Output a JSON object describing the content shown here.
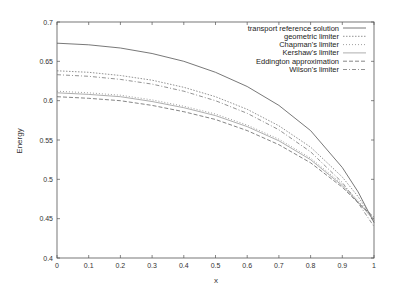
{
  "chart_data": {
    "type": "line",
    "title": "",
    "xlabel": "x",
    "ylabel": "Energy",
    "xlim": [
      0,
      1
    ],
    "ylim": [
      0.4,
      0.7
    ],
    "xticks": [
      "0",
      "0.1",
      "0.2",
      "0.3",
      "0.4",
      "0.5",
      "0.6",
      "0.7",
      "0.8",
      "0.9",
      "1"
    ],
    "yticks": [
      "0.4",
      "0.45",
      "0.5",
      "0.55",
      "0.6",
      "0.65",
      "0.7"
    ],
    "grid": false,
    "legend_position": "upper right (inside)",
    "x": [
      0,
      0.1,
      0.2,
      0.3,
      0.4,
      0.5,
      0.6,
      0.7,
      0.8,
      0.9,
      0.95,
      1.0
    ],
    "series": [
      {
        "name": "transport reference solution",
        "style": "solid",
        "color": "#555555",
        "values": [
          0.673,
          0.671,
          0.667,
          0.66,
          0.65,
          0.636,
          0.618,
          0.594,
          0.562,
          0.515,
          0.484,
          0.445
        ]
      },
      {
        "name": "geometric limiter",
        "style": "dotted",
        "color": "#777777",
        "values": [
          0.638,
          0.636,
          0.632,
          0.626,
          0.617,
          0.605,
          0.589,
          0.568,
          0.541,
          0.503,
          0.478,
          0.448
        ]
      },
      {
        "name": "Chapman's limiter",
        "style": "dotted-fine",
        "color": "#888888",
        "values": [
          0.612,
          0.61,
          0.607,
          0.601,
          0.593,
          0.583,
          0.569,
          0.551,
          0.527,
          0.494,
          0.473,
          0.45
        ]
      },
      {
        "name": "Kershaw's limiter",
        "style": "solid-light",
        "color": "#999999",
        "values": [
          0.61,
          0.608,
          0.605,
          0.599,
          0.591,
          0.581,
          0.567,
          0.549,
          0.525,
          0.492,
          0.471,
          0.448
        ]
      },
      {
        "name": "Eddington approximation",
        "style": "dashed",
        "color": "#666666",
        "values": [
          0.605,
          0.603,
          0.6,
          0.594,
          0.586,
          0.576,
          0.562,
          0.544,
          0.521,
          0.49,
          0.47,
          0.452
        ]
      },
      {
        "name": "Wilson's limiter",
        "style": "dash-dot",
        "color": "#777777",
        "values": [
          0.633,
          0.631,
          0.627,
          0.621,
          0.612,
          0.6,
          0.584,
          0.563,
          0.535,
          0.496,
          0.47,
          0.44
        ]
      }
    ]
  },
  "legend": {
    "items": [
      "transport reference solution",
      "geometric limiter",
      "Chapman's limiter",
      "Kershaw's limiter",
      "Eddington approximation",
      "Wilson's limiter"
    ]
  },
  "axes": {
    "xlabel": "x",
    "ylabel": "Energy"
  }
}
